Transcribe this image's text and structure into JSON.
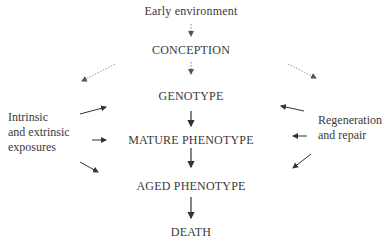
{
  "diagram": {
    "nodes": {
      "early_environment": "Early environment",
      "conception": "CONCEPTION",
      "genotype": "GENOTYPE",
      "mature_phenotype": "MATURE PHENOTYPE",
      "aged_phenotype": "AGED PHENOTYPE",
      "death": "DEATH"
    },
    "left_factor": {
      "line1": "Intrinsic",
      "line2": "and extrinsic",
      "line3": "exposures"
    },
    "right_factor": {
      "line1": "Regeneration",
      "line2": "and repair"
    },
    "colors": {
      "text": "#3a3a3a",
      "arrow_solid": "#333333",
      "arrow_dotted": "#888888"
    }
  }
}
